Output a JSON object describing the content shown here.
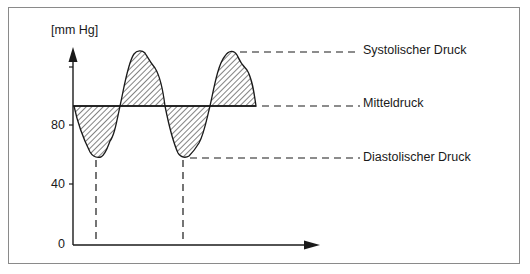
{
  "diagram": {
    "y_axis": {
      "unit_label": "[mm Hg]",
      "ticks": [
        {
          "label": "80",
          "value": 80
        },
        {
          "label": "40",
          "value": 40
        },
        {
          "label": "0",
          "value": 0
        }
      ],
      "unlabeled_tick_value": 120
    },
    "annotations": {
      "systolic": "Systolischer Druck",
      "mean": "Mitteldruck",
      "diastolic": "Diastolischer Druck"
    },
    "levels_mmHg": {
      "systolic": 129,
      "mean": 93,
      "diastolic": 58
    },
    "colors": {
      "line": "#1a1a1a",
      "frame": "#8a8a8a",
      "hatch": "#1a1a1a",
      "background": "#ffffff"
    }
  }
}
